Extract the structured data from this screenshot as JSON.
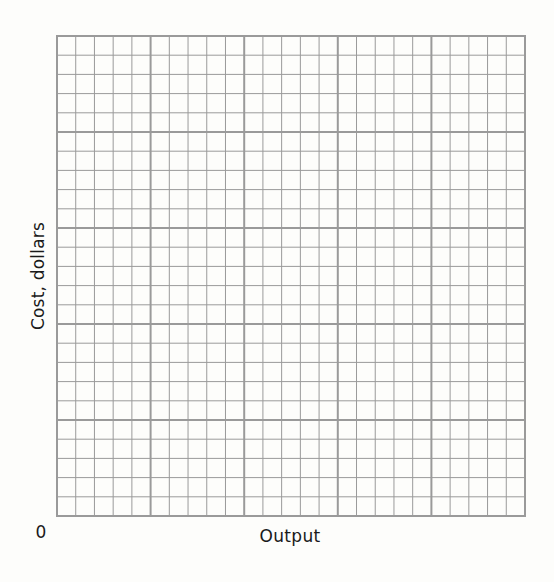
{
  "chart_data": {
    "type": "line",
    "title": "",
    "xlabel": "Output",
    "ylabel": "Cost, dollars",
    "origin_label": "0",
    "x": [],
    "series": [],
    "grid": {
      "on": true,
      "major_columns": 5,
      "major_rows": 5,
      "minor_per_major": 5,
      "line_color": "#9a9a9a",
      "major_line_width": 2,
      "minor_line_width": 1
    },
    "layout": {
      "plot_left": 57,
      "plot_top": 36,
      "plot_width": 468,
      "plot_height": 480
    },
    "legend": null,
    "note": "Blank graph paper for plotting cost against output; no data points plotted."
  },
  "colors": {
    "background": "#fdfdfb",
    "grid": "#9a9a9a",
    "text": "#1a1a1a"
  }
}
